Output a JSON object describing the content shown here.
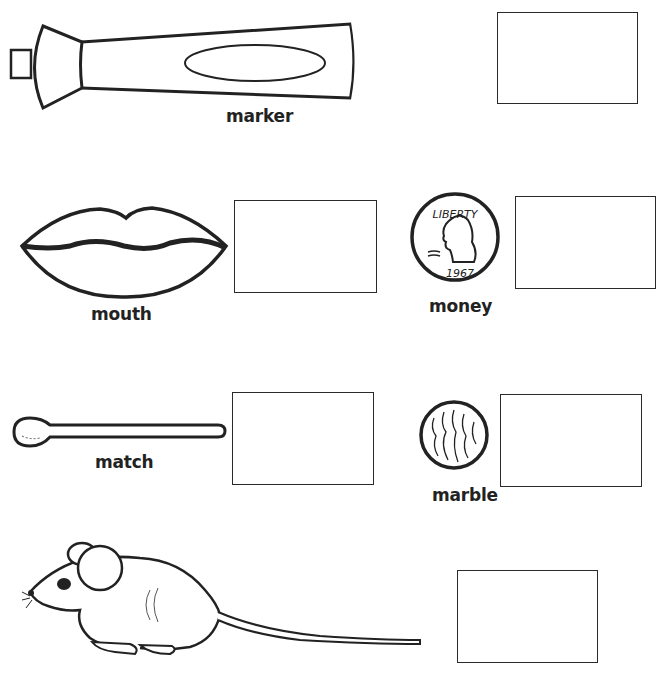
{
  "worksheet": {
    "items": [
      {
        "id": "marker",
        "label": "marker",
        "icon": "marker-icon"
      },
      {
        "id": "mouth",
        "label": "mouth",
        "icon": "lips-icon"
      },
      {
        "id": "money",
        "label": "money",
        "icon": "coin-icon",
        "coin_text": "LIBERTY",
        "coin_year": "1967"
      },
      {
        "id": "match",
        "label": "match",
        "icon": "match-icon"
      },
      {
        "id": "marble",
        "label": "marble",
        "icon": "marble-icon"
      },
      {
        "id": "mouse",
        "label": "",
        "icon": "mouse-icon"
      }
    ],
    "colors": {
      "ink": "#222222",
      "paper": "#ffffff"
    }
  }
}
